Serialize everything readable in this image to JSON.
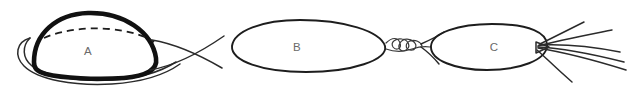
{
  "figure": {
    "kind": "hand-drawn-line-diagram",
    "background_color": "#ffffff",
    "ink_color": "#111111",
    "label_color": "#6a6a6a",
    "width": 634,
    "height": 93,
    "specimens": [
      {
        "id": "A",
        "label": "A",
        "label_x": 88,
        "label_y": 52,
        "description": "thick-outlined dome with dashed equator inside a thin lens outline",
        "outline_weight": "thick"
      },
      {
        "id": "B",
        "label": "B",
        "label_x": 297,
        "label_y": 48,
        "description": "plain ellipse with coiled twisted tail to the right",
        "outline_weight": "medium"
      },
      {
        "id": "C",
        "label": "C",
        "label_x": 494,
        "label_y": 48,
        "description": "plain ellipse with fanned straight filaments to the right",
        "outline_weight": "medium"
      }
    ]
  }
}
